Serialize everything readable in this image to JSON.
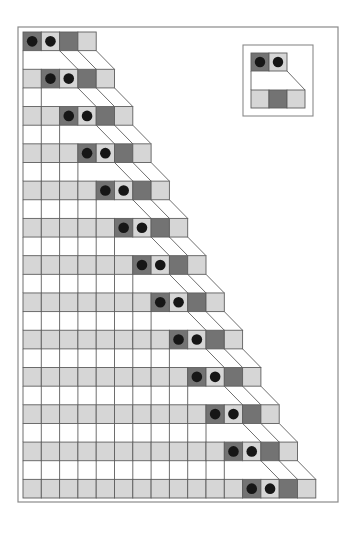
{
  "diagram": {
    "type": "staircase-cell-shift",
    "rows": 13,
    "pattern": [
      {
        "cell": "dark",
        "dot": true
      },
      {
        "cell": "light",
        "dot": true
      },
      {
        "cell": "dark",
        "dot": false
      },
      {
        "cell": "light",
        "dot": false
      }
    ],
    "row_offsets": [
      0,
      1,
      2,
      3,
      4,
      5,
      6,
      7,
      8,
      9,
      10,
      11,
      12
    ],
    "leading_fill": "light",
    "legend": {
      "top": [
        {
          "cell": "dark",
          "dot": true
        },
        {
          "cell": "light",
          "dot": true
        }
      ],
      "bottom": [
        {
          "cell": "light"
        },
        {
          "cell": "dark"
        },
        {
          "cell": "light"
        }
      ]
    }
  },
  "colors": {
    "dark": "#737373",
    "light": "#d6d6d6",
    "white": "#ffffff",
    "dot": "#161616",
    "line": "#5e5e5e",
    "frame": "#8a8a8a"
  },
  "geometry": {
    "frame": {
      "x": 18,
      "y": 27,
      "w": 320,
      "h": 475
    },
    "origin": {
      "x": 23,
      "y": 32
    },
    "cell_w": 18.3,
    "row_h": 18.64,
    "inset": {
      "x": 243,
      "y": 45,
      "w": 70,
      "h": 71,
      "cell": 18,
      "inner_x": 251,
      "top_y": 53,
      "bottom_y": 90
    }
  }
}
